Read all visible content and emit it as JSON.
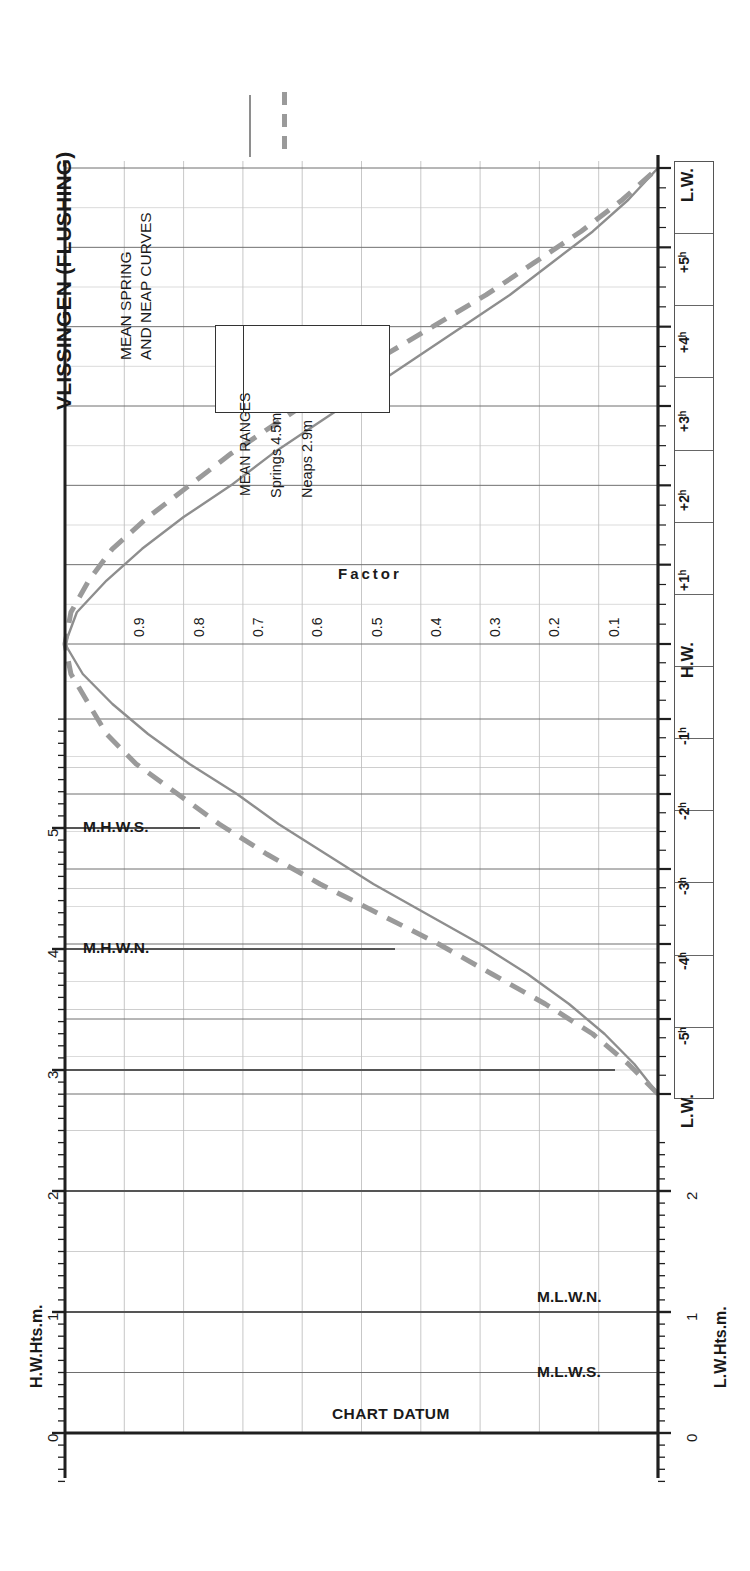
{
  "header": {
    "title": "VLISSINGEN (FLUSHING)",
    "subtitle_line1": "MEAN SPRING",
    "subtitle_line2": "AND NEAP CURVES"
  },
  "legend": {
    "heading": "MEAN RANGES",
    "rows": [
      {
        "label": "Springs 4.5m",
        "style": "solid",
        "color": "#8e8e8e"
      },
      {
        "label": "Neaps  2.9m",
        "style": "dashed",
        "color": "#9a9a9a"
      }
    ]
  },
  "axes": {
    "left_title": "H.W.Hts.m.",
    "right_title": "L.W.Hts.m.",
    "left_ticks": [
      "5",
      "4",
      "3",
      "2",
      "1",
      "0"
    ],
    "right_ticks": [
      "2",
      "1",
      "0"
    ],
    "factor_label": "Factor",
    "factor_ticks": [
      "0.9",
      "0.8",
      "0.7",
      "0.6",
      "0.5",
      "0.4",
      "0.3",
      "0.2",
      "0.1"
    ],
    "time_ticks": [
      "L.W.",
      "+5ʰ",
      "+4ʰ",
      "+3ʰ",
      "+2ʰ",
      "+1ʰ",
      "H.W.",
      "-1ʰ",
      "-2ʰ",
      "-3ʰ",
      "-4ʰ",
      "-5ʰ",
      "L.W."
    ]
  },
  "markers": {
    "chart_datum": "CHART DATUM",
    "mhws": "M.H.W.S.",
    "mhwn": "M.H.W.N.",
    "mlwn": "M.L.W.N.",
    "mlws": "M.L.W.S."
  },
  "colors": {
    "spring_curve": "#8e8e8e",
    "neap_curve": "#9a9a9a",
    "grid_minor": "#b9b9b9",
    "grid_major": "#7a7a7a",
    "axis": "#1f1f1f",
    "marker_line": "#555555"
  },
  "chart_data": {
    "type": "line",
    "xlabel": "Factor",
    "ylabel": "Hours relative to H.W. / L.W.",
    "orientation": "vertical-time-axis",
    "xlim": [
      0.0,
      1.0
    ],
    "grid": true,
    "legend_position": "top-left",
    "mean_ranges": {
      "springs_m": 4.5,
      "neaps_m": 2.9
    },
    "datum_levels_m": {
      "MHWS": 5.0,
      "MHWN": 4.0,
      "MLWN": 1.0,
      "MLWS": 0.5,
      "CHART_DATUM": 0.0
    },
    "left_axis_range_m": [
      0,
      5.8
    ],
    "right_axis_range_m": [
      0,
      2.4
    ],
    "time_axis_hours": [
      -6,
      -5,
      -4,
      -3,
      -2,
      -1,
      0,
      1,
      2,
      3,
      4,
      5,
      6
    ],
    "series": [
      {
        "name": "Springs 4.5m",
        "style": "solid",
        "points_hours_factor": [
          [
            -6.0,
            0.0
          ],
          [
            -5.6,
            0.04
          ],
          [
            -5.2,
            0.09
          ],
          [
            -4.8,
            0.15
          ],
          [
            -4.4,
            0.22
          ],
          [
            -4.0,
            0.3
          ],
          [
            -3.6,
            0.39
          ],
          [
            -3.2,
            0.48
          ],
          [
            -2.8,
            0.56
          ],
          [
            -2.4,
            0.64
          ],
          [
            -2.0,
            0.71
          ],
          [
            -1.6,
            0.79
          ],
          [
            -1.2,
            0.86
          ],
          [
            -0.8,
            0.92
          ],
          [
            -0.4,
            0.97
          ],
          [
            0.0,
            1.0
          ],
          [
            0.4,
            0.98
          ],
          [
            0.8,
            0.93
          ],
          [
            1.2,
            0.87
          ],
          [
            1.6,
            0.8
          ],
          [
            2.0,
            0.72
          ],
          [
            2.4,
            0.65
          ],
          [
            2.8,
            0.57
          ],
          [
            3.2,
            0.49
          ],
          [
            3.6,
            0.41
          ],
          [
            4.0,
            0.33
          ],
          [
            4.4,
            0.25
          ],
          [
            4.8,
            0.18
          ],
          [
            5.2,
            0.11
          ],
          [
            5.6,
            0.05
          ],
          [
            6.0,
            0.0
          ]
        ]
      },
      {
        "name": "Neaps 2.9m",
        "style": "dashed",
        "points_hours_factor": [
          [
            -6.0,
            0.0
          ],
          [
            -5.6,
            0.05
          ],
          [
            -5.2,
            0.11
          ],
          [
            -4.8,
            0.19
          ],
          [
            -4.4,
            0.28
          ],
          [
            -4.0,
            0.37
          ],
          [
            -3.6,
            0.47
          ],
          [
            -3.2,
            0.57
          ],
          [
            -2.8,
            0.66
          ],
          [
            -2.4,
            0.74
          ],
          [
            -2.0,
            0.81
          ],
          [
            -1.6,
            0.88
          ],
          [
            -1.2,
            0.93
          ],
          [
            -0.8,
            0.96
          ],
          [
            -0.4,
            0.99
          ],
          [
            0.0,
            1.0
          ],
          [
            0.4,
            0.99
          ],
          [
            0.8,
            0.96
          ],
          [
            1.2,
            0.92
          ],
          [
            1.6,
            0.86
          ],
          [
            2.0,
            0.79
          ],
          [
            2.4,
            0.72
          ],
          [
            2.8,
            0.64
          ],
          [
            3.2,
            0.56
          ],
          [
            3.6,
            0.47
          ],
          [
            4.0,
            0.38
          ],
          [
            4.4,
            0.29
          ],
          [
            4.8,
            0.21
          ],
          [
            5.2,
            0.13
          ],
          [
            5.6,
            0.06
          ],
          [
            6.0,
            0.0
          ]
        ]
      }
    ]
  }
}
